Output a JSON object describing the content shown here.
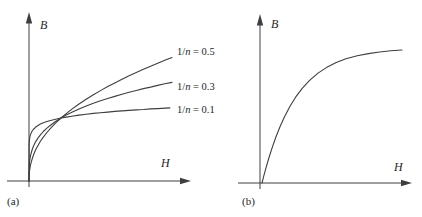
{
  "colors": {
    "stroke": "#3f3f3f",
    "text": "#262626",
    "background": "#ffffff"
  },
  "panels": {
    "a": {
      "caption": "(a)",
      "x_label": "H",
      "y_label": "B",
      "curve_labels": [
        {
          "pre": "1/",
          "sym": "n",
          "post": " = 0.5"
        },
        {
          "pre": "1/",
          "sym": "n",
          "post": " = 0.3"
        },
        {
          "pre": "1/",
          "sym": "n",
          "post": " = 0.1"
        }
      ]
    },
    "b": {
      "caption": "(b)",
      "x_label": "H",
      "y_label": "B"
    }
  },
  "chart_data": [
    {
      "type": "line",
      "panel": "(a)",
      "title": "",
      "xlabel": "H",
      "ylabel": "B",
      "xlim": [
        0,
        1
      ],
      "ylim": [
        0,
        1
      ],
      "grid": false,
      "legend_position": "right-of-curve-ends",
      "series": [
        {
          "name": "1/n = 0.5",
          "points": [
            [
              0,
              0
            ],
            [
              0.002,
              0.058
            ],
            [
              0.005,
              0.087
            ],
            [
              0.01,
              0.119
            ],
            [
              0.02,
              0.162
            ],
            [
              0.03,
              0.195
            ],
            [
              0.045,
              0.234
            ],
            [
              0.06,
              0.266
            ],
            [
              0.08,
              0.303
            ],
            [
              0.1,
              0.335
            ],
            [
              0.125,
              0.37
            ],
            [
              0.15,
              0.402
            ],
            [
              0.185,
              0.441
            ],
            [
              0.224,
              0.481
            ],
            [
              0.26,
              0.514
            ],
            [
              0.3,
              0.549
            ],
            [
              0.35,
              0.588
            ],
            [
              0.4,
              0.624
            ],
            [
              0.45,
              0.658
            ],
            [
              0.5,
              0.69
            ],
            [
              0.55,
              0.721
            ],
            [
              0.6,
              0.749
            ],
            [
              0.65,
              0.777
            ],
            [
              0.7,
              0.803
            ],
            [
              0.75,
              0.828
            ],
            [
              0.8,
              0.853
            ],
            [
              0.85,
              0.876
            ],
            [
              0.9,
              0.899
            ],
            [
              0.95,
              0.921
            ],
            [
              1,
              0.943
            ]
          ]
        },
        {
          "name": "1/n = 0.3",
          "points": [
            [
              0,
              0
            ],
            [
              0.002,
              0.117
            ],
            [
              0.005,
              0.154
            ],
            [
              0.01,
              0.189
            ],
            [
              0.02,
              0.233
            ],
            [
              0.03,
              0.263
            ],
            [
              0.045,
              0.297
            ],
            [
              0.06,
              0.324
            ],
            [
              0.08,
              0.353
            ],
            [
              0.1,
              0.378
            ],
            [
              0.125,
              0.404
            ],
            [
              0.15,
              0.426
            ],
            [
              0.185,
              0.454
            ],
            [
              0.224,
              0.481
            ],
            [
              0.26,
              0.503
            ],
            [
              0.3,
              0.525
            ],
            [
              0.35,
              0.55
            ],
            [
              0.4,
              0.572
            ],
            [
              0.45,
              0.593
            ],
            [
              0.5,
              0.612
            ],
            [
              0.55,
              0.63
            ],
            [
              0.6,
              0.646
            ],
            [
              0.65,
              0.662
            ],
            [
              0.7,
              0.677
            ],
            [
              0.75,
              0.691
            ],
            [
              0.8,
              0.705
            ],
            [
              0.85,
              0.717
            ],
            [
              0.9,
              0.73
            ],
            [
              0.95,
              0.742
            ],
            [
              1,
              0.753
            ]
          ]
        },
        {
          "name": "1/n = 0.1",
          "points": [
            [
              0,
              0
            ],
            [
              0.001,
              0.28
            ],
            [
              0.002,
              0.3
            ],
            [
              0.005,
              0.329
            ],
            [
              0.01,
              0.352
            ],
            [
              0.02,
              0.378
            ],
            [
              0.03,
              0.393
            ],
            [
              0.045,
              0.41
            ],
            [
              0.06,
              0.422
            ],
            [
              0.08,
              0.434
            ],
            [
              0.1,
              0.444
            ],
            [
              0.125,
              0.454
            ],
            [
              0.15,
              0.462
            ],
            [
              0.185,
              0.472
            ],
            [
              0.224,
              0.481
            ],
            [
              0.26,
              0.488
            ],
            [
              0.3,
              0.495
            ],
            [
              0.35,
              0.503
            ],
            [
              0.4,
              0.51
            ],
            [
              0.45,
              0.516
            ],
            [
              0.5,
              0.521
            ],
            [
              0.55,
              0.526
            ],
            [
              0.6,
              0.531
            ],
            [
              0.65,
              0.535
            ],
            [
              0.7,
              0.539
            ],
            [
              0.75,
              0.543
            ],
            [
              0.8,
              0.546
            ],
            [
              0.85,
              0.55
            ],
            [
              0.9,
              0.553
            ],
            [
              0.985,
              0.558
            ]
          ]
        }
      ]
    },
    {
      "type": "line",
      "panel": "(b)",
      "title": "",
      "xlabel": "H",
      "ylabel": "B",
      "xlim": [
        0,
        1
      ],
      "ylim": [
        0,
        1
      ],
      "grid": false,
      "series": [
        {
          "name": "B-H saturation curve",
          "points": [
            [
              0,
              0
            ],
            [
              0.01,
              0.042
            ],
            [
              0.025,
              0.101
            ],
            [
              0.05,
              0.192
            ],
            [
              0.075,
              0.274
            ],
            [
              0.1,
              0.348
            ],
            [
              0.13,
              0.427
            ],
            [
              0.16,
              0.497
            ],
            [
              0.2,
              0.577
            ],
            [
              0.24,
              0.645
            ],
            [
              0.29,
              0.715
            ],
            [
              0.34,
              0.772
            ],
            [
              0.4,
              0.826
            ],
            [
              0.46,
              0.868
            ],
            [
              0.53,
              0.906
            ],
            [
              0.6,
              0.934
            ],
            [
              0.68,
              0.957
            ],
            [
              0.76,
              0.973
            ],
            [
              0.84,
              0.985
            ],
            [
              0.92,
              0.994
            ],
            [
              1,
              1
            ]
          ]
        }
      ]
    }
  ]
}
